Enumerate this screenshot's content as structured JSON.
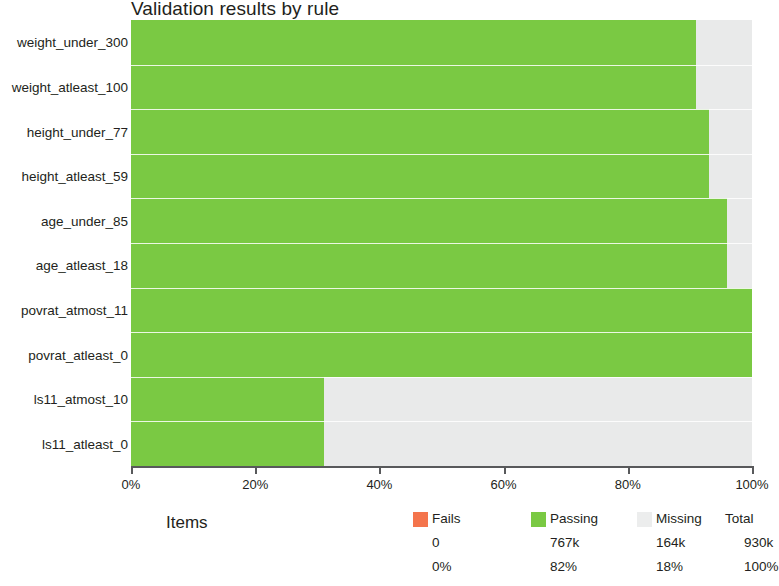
{
  "chart_data": {
    "type": "bar",
    "orientation": "horizontal",
    "stacked": true,
    "title": "Validation results by rule",
    "xlabel": "",
    "ylabel": "",
    "xlim": [
      0,
      100
    ],
    "xtick_labels": [
      "0%",
      "20%",
      "40%",
      "60%",
      "80%",
      "100%"
    ],
    "xtick_values": [
      0,
      20,
      40,
      60,
      80,
      100
    ],
    "grid": false,
    "legend_position": "bottom",
    "categories": [
      "weight_under_300",
      "weight_atleast_100",
      "height_under_77",
      "height_atleast_59",
      "age_under_85",
      "age_atleast_18",
      "povrat_atmost_11",
      "povrat_atleast_0",
      "ls11_atmost_10",
      "ls11_atleast_0"
    ],
    "series": [
      {
        "name": "Fails",
        "color": "#f4744c",
        "values": [
          0,
          0,
          0,
          0,
          0,
          0,
          0,
          0,
          0,
          0
        ]
      },
      {
        "name": "Passing",
        "color": "#7ac943",
        "values": [
          91,
          91,
          93,
          93,
          96,
          96,
          100,
          100,
          31,
          31
        ]
      },
      {
        "name": "Missing",
        "color": "#e9eaea",
        "values": [
          9,
          9,
          7,
          7,
          4,
          4,
          0,
          0,
          69,
          69
        ]
      }
    ]
  },
  "items_label": "Items",
  "legend": {
    "headers": [
      "Fails",
      "Passing",
      "Missing",
      "Total"
    ],
    "counts": [
      "0",
      "767k",
      "164k",
      "930k"
    ],
    "percents": [
      "0%",
      "82%",
      "18%",
      "100%"
    ],
    "swatch_names": [
      "fails-swatch",
      "passing-swatch",
      "missing-swatch",
      ""
    ]
  }
}
